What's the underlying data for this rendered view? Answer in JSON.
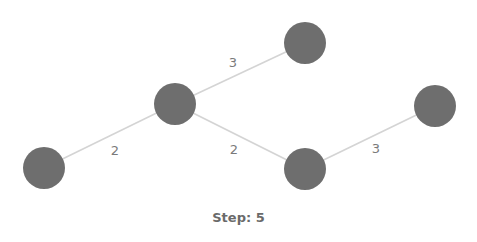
{
  "diagram": {
    "type": "weighted-graph",
    "node_color": "#6e6e6e",
    "edge_color": "#d4d4d4",
    "label_color": "#7a7a7a",
    "node_radius": 21,
    "nodes": [
      {
        "id": "n1",
        "x": 44,
        "y": 168
      },
      {
        "id": "n2",
        "x": 175,
        "y": 104
      },
      {
        "id": "n3",
        "x": 305,
        "y": 43
      },
      {
        "id": "n4",
        "x": 305,
        "y": 169
      },
      {
        "id": "n5",
        "x": 435,
        "y": 106
      }
    ],
    "edges": [
      {
        "from": "n1",
        "to": "n2",
        "weight": "2",
        "label_x": 115,
        "label_y": 151
      },
      {
        "from": "n2",
        "to": "n3",
        "weight": "3",
        "label_x": 233,
        "label_y": 63
      },
      {
        "from": "n2",
        "to": "n4",
        "weight": "2",
        "label_x": 234,
        "label_y": 150
      },
      {
        "from": "n4",
        "to": "n5",
        "weight": "3",
        "label_x": 376,
        "label_y": 149
      }
    ]
  },
  "status": {
    "step_text": "Step: 5"
  }
}
